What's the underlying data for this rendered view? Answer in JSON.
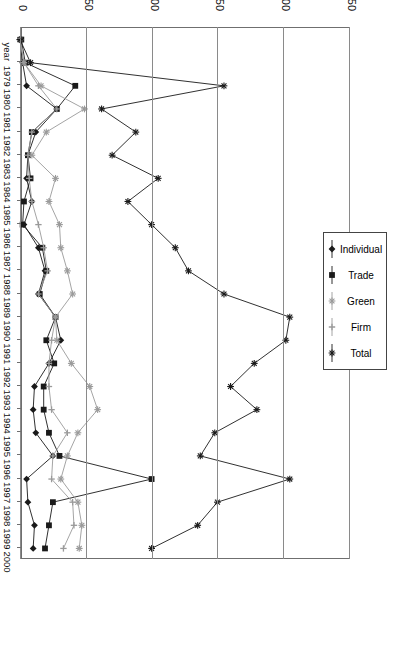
{
  "chart_data": {
    "type": "line",
    "title": "",
    "orientation": "rotated-90",
    "xlabel": "year",
    "ylabel": "",
    "ylim": [
      0,
      250
    ],
    "yticks": [
      0,
      50,
      100,
      150,
      200,
      250
    ],
    "grid": true,
    "legend_position": "top-right",
    "categories": [
      "year",
      "1979",
      "1980",
      "1981",
      "1982",
      "1983",
      "1984",
      "1985",
      "1986",
      "1987",
      "1988",
      "1989",
      "1990",
      "1991",
      "1992",
      "1993",
      "1994",
      "1995",
      "1996",
      "1997",
      "1998",
      "1999",
      "2000"
    ],
    "series": [
      {
        "name": "Individual",
        "marker": "diamond",
        "color": "#1a1a1a",
        "values": [
          0,
          2,
          5,
          28,
          12,
          6,
          5,
          9,
          3,
          14,
          19,
          14,
          27,
          31,
          22,
          11,
          10,
          12,
          25,
          5,
          6,
          11,
          10
        ]
      },
      {
        "name": "Trade",
        "marker": "square",
        "color": "#1a1a1a",
        "values": [
          1,
          4,
          42,
          28,
          9,
          6,
          8,
          3,
          2,
          17,
          20,
          15,
          27,
          20,
          26,
          18,
          18,
          22,
          30,
          100,
          25,
          22,
          19
        ]
      },
      {
        "name": "Green",
        "marker": "asterisk",
        "color": "#9a9a9a",
        "values": [
          0,
          3,
          16,
          49,
          20,
          9,
          27,
          22,
          30,
          31,
          36,
          40,
          27,
          28,
          39,
          53,
          59,
          44,
          36,
          31,
          44,
          47,
          45
        ]
      },
      {
        "name": "Firm",
        "marker": "plus",
        "color": "#9a9a9a",
        "values": [
          0,
          3,
          14,
          28,
          9,
          6,
          7,
          9,
          14,
          18,
          21,
          14,
          27,
          24,
          22,
          22,
          24,
          36,
          25,
          24,
          40,
          41,
          33
        ]
      },
      {
        "name": "Total",
        "marker": "star",
        "color": "#1a1a1a",
        "values": [
          0,
          8,
          155,
          62,
          88,
          70,
          105,
          82,
          100,
          118,
          128,
          155,
          205,
          202,
          178,
          160,
          180,
          148,
          137,
          205,
          150,
          135,
          100
        ]
      }
    ]
  },
  "legend": {
    "items": [
      {
        "label": "Individual",
        "marker": "diamond",
        "color": "#1a1a1a"
      },
      {
        "label": "Trade",
        "marker": "square",
        "color": "#1a1a1a"
      },
      {
        "label": "Green",
        "marker": "asterisk",
        "color": "#9a9a9a"
      },
      {
        "label": "Firm",
        "marker": "plus",
        "color": "#9a9a9a"
      },
      {
        "label": "Total",
        "marker": "star",
        "color": "#1a1a1a"
      }
    ]
  },
  "axes": {
    "value_axis_labels": [
      "0",
      "50",
      "100",
      "150",
      "200",
      "250"
    ],
    "category_axis_labels": [
      "year",
      "1979",
      "1980",
      "1981",
      "1982",
      "1983",
      "1984",
      "1985",
      "1986",
      "1987",
      "1988",
      "1989",
      "1990",
      "1991",
      "1992",
      "1993",
      "1994",
      "1995",
      "1996",
      "1997",
      "1998",
      "1999",
      "2000"
    ]
  }
}
